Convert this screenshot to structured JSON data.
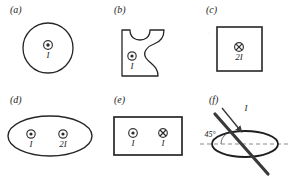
{
  "figure": {
    "stroke_color": "#262626",
    "dash_color": "#8a8a8a",
    "wire_color": "#3a3a3a",
    "background": "#ffffff"
  },
  "panels": [
    {
      "id": "a",
      "label": "(a)",
      "loop_shape": "circle",
      "currents": [
        {
          "label": "I",
          "direction": "out-of-page",
          "symbol": "dot-circle-icon"
        }
      ]
    },
    {
      "id": "b",
      "label": "(b)",
      "loop_shape": "irregular-blob",
      "currents": [
        {
          "label": "I",
          "direction": "out-of-page",
          "symbol": "dot-circle-icon"
        }
      ]
    },
    {
      "id": "c",
      "label": "(c)",
      "loop_shape": "square",
      "currents": [
        {
          "label": "2I",
          "direction": "into-page",
          "symbol": "cross-circle-icon"
        }
      ]
    },
    {
      "id": "d",
      "label": "(d)",
      "loop_shape": "ellipse",
      "currents": [
        {
          "label": "I",
          "direction": "out-of-page",
          "symbol": "dot-circle-icon"
        },
        {
          "label": "2I",
          "direction": "out-of-page",
          "symbol": "dot-circle-icon"
        }
      ]
    },
    {
      "id": "e",
      "label": "(e)",
      "loop_shape": "rectangle",
      "currents": [
        {
          "label": "I",
          "direction": "out-of-page",
          "symbol": "dot-circle-icon"
        },
        {
          "label": "I",
          "direction": "into-page",
          "symbol": "cross-circle-icon"
        }
      ]
    },
    {
      "id": "f",
      "label": "(f)",
      "loop_shape": "ellipse-tilted-wire",
      "angle_label": "45°",
      "currents": [
        {
          "label": "I",
          "direction": "slanted-45-degrees",
          "symbol": "arrow-wire-icon"
        }
      ]
    }
  ],
  "labels": {
    "a_panel": "(a)",
    "b_panel": "(b)",
    "c_panel": "(c)",
    "d_panel": "(d)",
    "e_panel": "(e)",
    "f_panel": "(f)",
    "a_current": "I",
    "b_current": "I",
    "c_current": "2I",
    "d_current_1": "I",
    "d_current_2": "2I",
    "e_current_1": "I",
    "e_current_2": "I",
    "f_current": "I",
    "f_angle": "45°"
  }
}
